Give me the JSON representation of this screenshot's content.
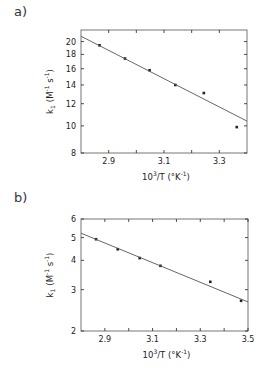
{
  "chart_data": [
    {
      "panel": "a)",
      "type": "scatter",
      "title": "",
      "xlabel": "10³/T (°K⁻¹)",
      "ylabel": "k₁ (M⁻¹ s⁻¹)",
      "xscale": "linear",
      "yscale": "log",
      "xlim": [
        2.8,
        3.4
      ],
      "ylim": [
        8,
        22
      ],
      "xticks": [
        2.9,
        3.1,
        3.3
      ],
      "xminor_ticks": [
        3.0,
        3.2
      ],
      "yticks": [
        8,
        10,
        12,
        14,
        16,
        18,
        20
      ],
      "grid": false,
      "legend": null,
      "series": [
        {
          "name": "data",
          "style": "points",
          "x": [
            2.867,
            2.959,
            3.048,
            3.141,
            3.244,
            3.363
          ],
          "y": [
            19.4,
            17.4,
            15.8,
            14.0,
            13.1,
            9.9
          ]
        },
        {
          "name": "fit",
          "style": "line",
          "x": [
            2.8,
            3.4
          ],
          "y": [
            20.9,
            10.4
          ]
        }
      ]
    },
    {
      "panel": "b)",
      "type": "scatter",
      "title": "",
      "xlabel": "10³/T (°K⁻¹)",
      "ylabel": "k₁ (M⁻¹ s⁻¹)",
      "xscale": "linear",
      "yscale": "log",
      "xlim": [
        2.8,
        3.5
      ],
      "ylim": [
        2,
        6
      ],
      "xticks": [
        2.9,
        3.1,
        3.3,
        3.5
      ],
      "xminor_ticks": [
        3.0,
        3.2,
        3.4
      ],
      "yticks": [
        2,
        3,
        4,
        5,
        6
      ],
      "grid": false,
      "legend": null,
      "series": [
        {
          "name": "data",
          "style": "points",
          "x": [
            2.863,
            2.954,
            3.046,
            3.133,
            3.342,
            3.471
          ],
          "y": [
            4.92,
            4.46,
            4.09,
            3.79,
            3.24,
            2.69
          ]
        },
        {
          "name": "fit",
          "style": "line",
          "x": [
            2.8,
            3.5
          ],
          "y": [
            5.22,
            2.66
          ]
        }
      ]
    }
  ],
  "panels": {
    "a": {
      "label": "a)"
    },
    "b": {
      "label": "b)"
    }
  },
  "axis_text": {
    "xlabel_main": "10",
    "xlabel_sup": "3",
    "xlabel_rest": "/T (°K",
    "xlabel_exp": "-1",
    "xlabel_close": ")",
    "ylabel_k": "k",
    "ylabel_sub": "1",
    "ylabel_units": "(M",
    "ylabel_exp1": "-1",
    "ylabel_s": " s",
    "ylabel_exp2": "-1",
    "ylabel_close": ")"
  },
  "colors": {
    "ink": "#222222",
    "line": "#555555",
    "frame": "#777777"
  }
}
